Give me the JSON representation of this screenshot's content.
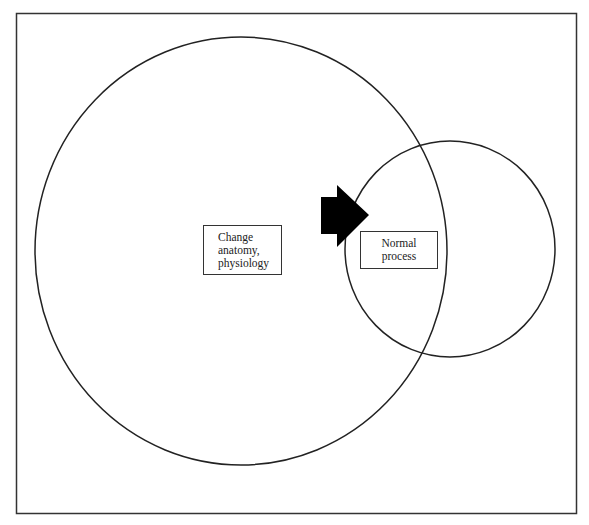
{
  "diagram": {
    "type": "venn-overlap",
    "frame": {
      "stroke": "#333333"
    },
    "circles": [
      {
        "id": "large",
        "label_lines": [
          "Change",
          "anatomy,",
          "physiology"
        ],
        "cx": 241,
        "cy": 251,
        "rx": 206,
        "ry": 214
      },
      {
        "id": "small",
        "label_lines": [
          "Normal",
          "process"
        ],
        "cx": 450,
        "cy": 249,
        "rx": 105,
        "ry": 108
      }
    ],
    "arrow": {
      "direction": "right",
      "color": "#000000",
      "from": "large",
      "to": "small"
    }
  }
}
